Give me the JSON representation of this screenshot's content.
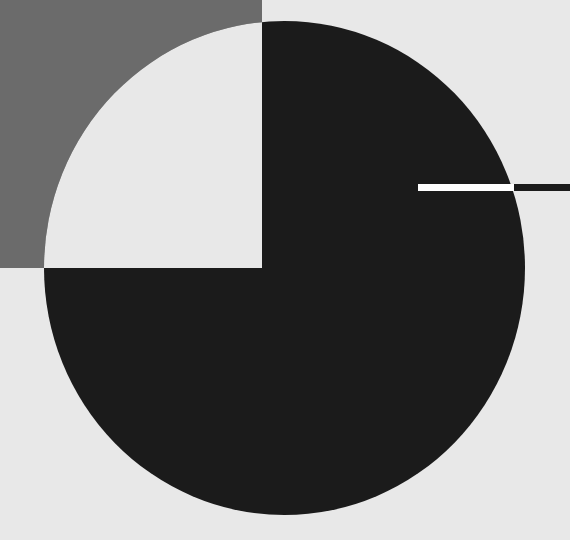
{
  "artwork": {
    "colors": {
      "background": "#e8e8e8",
      "gray_square": "#6b6b6b",
      "black": "#1b1b1b",
      "white_bar": "#ffffff"
    },
    "shapes": {
      "gray_square": {
        "x": 0,
        "y": 0,
        "w": 262,
        "h": 268
      },
      "circle": {
        "cx": 284.5,
        "cy": 268,
        "rx": 240.5,
        "ry": 247
      },
      "white_bar": {
        "x": 418,
        "y": 184,
        "w": 96,
        "h": 7
      },
      "black_bar": {
        "x": 514,
        "y": 184,
        "w": 56,
        "h": 7
      }
    }
  }
}
